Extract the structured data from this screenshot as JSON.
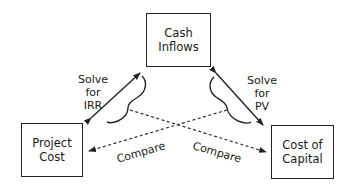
{
  "diagram": {
    "nodes": {
      "cash_inflows": {
        "line1": "Cash",
        "line2": "Inflows"
      },
      "project_cost": {
        "line1": "Project",
        "line2": "Cost"
      },
      "cost_of_capital": {
        "line1": "Cost of",
        "line2": "Capital"
      }
    },
    "edges": {
      "solve_irr": {
        "line1": "Solve",
        "line2": "for",
        "line3": "IRR"
      },
      "solve_pv": {
        "line1": "Solve",
        "line2": "for",
        "line3": "PV"
      },
      "compare_left": "Compare",
      "compare_right": "Compare"
    },
    "colors": {
      "line": "#222222",
      "background": "#ffffff"
    }
  }
}
